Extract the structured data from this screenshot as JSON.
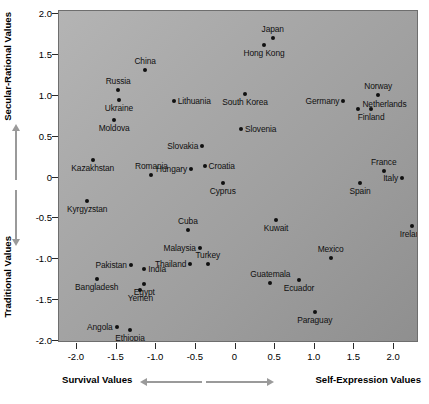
{
  "chart_data": {
    "type": "scatter",
    "title": "",
    "xlabel": "Survival Values / Self-Expression Values",
    "ylabel": "Traditional Values / Secular-Rational Values",
    "xlim": [
      -2.3,
      2.3
    ],
    "ylim": [
      -2.2,
      2.05
    ],
    "grid": false,
    "legend": "none",
    "axis_titles": {
      "y_upper": "Secular-Rational Values",
      "y_lower": "Traditional Values",
      "x_left": "Survival Values",
      "x_right": "Self-Expression Values"
    },
    "xticks": [
      -2.0,
      -1.5,
      -1.0,
      -0.5,
      0,
      0.5,
      1.0,
      1.5,
      2.0
    ],
    "xticklabels": [
      "-2.0",
      "-1.5",
      "-1.0",
      "-0.5",
      "0",
      "0.5",
      "1.0",
      "1.5",
      "2.0"
    ],
    "yticks": [
      2.0,
      1.5,
      1.0,
      0.5,
      0,
      -0.5,
      -1.0,
      -1.5,
      -2.0
    ],
    "yticklabels": [
      "2.0",
      "1.5",
      "1.0",
      "0.5",
      "0",
      "-0.5",
      "-1.0",
      "-1.5",
      "-2.0"
    ],
    "points": [
      {
        "label": "Japan",
        "x": 0.47,
        "y": 1.7,
        "lp": "above"
      },
      {
        "label": "Hong Kong",
        "x": 0.36,
        "y": 1.62,
        "lp": "below"
      },
      {
        "label": "China",
        "x": -1.14,
        "y": 1.31,
        "lp": "above"
      },
      {
        "label": "Russia",
        "x": -1.48,
        "y": 1.07,
        "lp": "above"
      },
      {
        "label": "South Korea",
        "x": 0.12,
        "y": 1.02,
        "lp": "below"
      },
      {
        "label": "Norway",
        "x": 1.8,
        "y": 1.01,
        "lp": "above"
      },
      {
        "label": "Ukraine",
        "x": -1.47,
        "y": 0.95,
        "lp": "below"
      },
      {
        "label": "Germany",
        "x": 1.36,
        "y": 0.94,
        "lp": "left"
      },
      {
        "label": "Lithuania",
        "x": -0.78,
        "y": 0.93,
        "lp": "right"
      },
      {
        "label": "Netherlands",
        "x": 1.55,
        "y": 0.84,
        "lp": "right-up"
      },
      {
        "label": "Finland",
        "x": 1.71,
        "y": 0.84,
        "lp": "below"
      },
      {
        "label": "Moldova",
        "x": -1.53,
        "y": 0.7,
        "lp": "below"
      },
      {
        "label": "Slovenia",
        "x": 0.07,
        "y": 0.59,
        "lp": "right"
      },
      {
        "label": "Slovakia",
        "x": -0.42,
        "y": 0.38,
        "lp": "left"
      },
      {
        "label": "Croatia",
        "x": -0.39,
        "y": 0.14,
        "lp": "right"
      },
      {
        "label": "France",
        "x": 1.87,
        "y": 0.08,
        "lp": "above"
      },
      {
        "label": "Hungary",
        "x": -0.56,
        "y": 0.1,
        "lp": "left"
      },
      {
        "label": "Kazakhstan",
        "x": -1.8,
        "y": 0.21,
        "lp": "below"
      },
      {
        "label": "Italy",
        "x": 2.1,
        "y": 0.0,
        "lp": "left"
      },
      {
        "label": "Romania",
        "x": -1.06,
        "y": 0.03,
        "lp": "above"
      },
      {
        "label": "Cyprus",
        "x": -0.16,
        "y": -0.07,
        "lp": "below"
      },
      {
        "label": "Spain",
        "x": 1.57,
        "y": -0.07,
        "lp": "below"
      },
      {
        "label": "United States",
        "x": 3.57,
        "y": -0.2,
        "lp": "above"
      },
      {
        "label": "Kyrgyzstan",
        "x": -1.87,
        "y": -0.29,
        "lp": "below"
      },
      {
        "label": "Great Britain",
        "x": 3.05,
        "y": -0.36,
        "lp": "left"
      },
      {
        "label": "Canada",
        "x": 3.39,
        "y": -0.36,
        "lp": "below"
      },
      {
        "label": "Cuba",
        "x": -0.6,
        "y": -0.64,
        "lp": "above"
      },
      {
        "label": "Kuwait",
        "x": 0.51,
        "y": -0.52,
        "lp": "below"
      },
      {
        "label": "Ireland",
        "x": 2.23,
        "y": -0.59,
        "lp": "below"
      },
      {
        "label": "Malaysia",
        "x": -0.45,
        "y": -0.86,
        "lp": "left"
      },
      {
        "label": "Turkey",
        "x": -0.35,
        "y": -1.06,
        "lp": "above"
      },
      {
        "label": "Mexico",
        "x": 1.2,
        "y": -0.99,
        "lp": "above"
      },
      {
        "label": "Thailand",
        "x": -0.57,
        "y": -1.06,
        "lp": "left"
      },
      {
        "label": "Pakistan",
        "x": -1.32,
        "y": -1.07,
        "lp": "left"
      },
      {
        "label": "India",
        "x": -1.15,
        "y": -1.12,
        "lp": "right"
      },
      {
        "label": "Guatemala",
        "x": 0.44,
        "y": -1.29,
        "lp": "above"
      },
      {
        "label": "Bangladesh",
        "x": -1.75,
        "y": -1.24,
        "lp": "below"
      },
      {
        "label": "Egypt",
        "x": -1.15,
        "y": -1.3,
        "lp": "below"
      },
      {
        "label": "Ecuador",
        "x": 0.8,
        "y": -1.25,
        "lp": "below"
      },
      {
        "label": "Yemen",
        "x": -1.2,
        "y": -1.37,
        "lp": "below"
      },
      {
        "label": "Angola",
        "x": -1.5,
        "y": -1.83,
        "lp": "left"
      },
      {
        "label": "Ethiopia",
        "x": -1.33,
        "y": -1.87,
        "lp": "below"
      },
      {
        "label": "Paraguay",
        "x": 1.0,
        "y": -1.65,
        "lp": "below"
      }
    ]
  }
}
